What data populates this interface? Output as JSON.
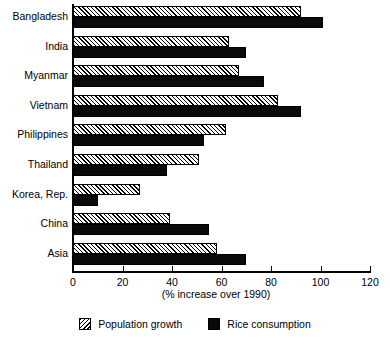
{
  "chart_data": {
    "type": "bar",
    "orientation": "horizontal",
    "title": "",
    "xlabel": "(% increase over 1990)",
    "ylabel": "",
    "xlim": [
      0,
      120
    ],
    "xticks": [
      0,
      20,
      40,
      60,
      80,
      100,
      120
    ],
    "grid": false,
    "legend_position": "bottom",
    "categories": [
      "Bangladesh",
      "India",
      "Myanmar",
      "Vietnam",
      "Philippines",
      "Thailand",
      "Korea, Rep.",
      "China",
      "Asia"
    ],
    "series": [
      {
        "name": "Population growth",
        "fill": "hatched",
        "color": "#ffffff",
        "values": [
          92,
          63,
          67,
          83,
          62,
          51,
          27,
          39,
          58
        ]
      },
      {
        "name": "Rice consumption",
        "fill": "solid",
        "color": "#0a0a0a",
        "values": [
          101,
          70,
          77,
          92,
          53,
          38,
          10,
          55,
          70
        ]
      }
    ]
  },
  "legend": {
    "items": [
      {
        "label": "Population growth",
        "swatch": "hatched-swatch"
      },
      {
        "label": "Rice consumption",
        "swatch": "solid-black-swatch"
      }
    ]
  }
}
